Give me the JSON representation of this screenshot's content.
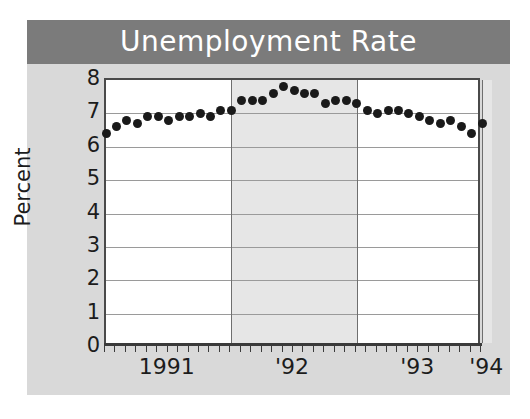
{
  "figure": {
    "title": "Unemployment Rate",
    "background_color": "#ffffff",
    "panel_color": "#d9d9d9",
    "title_bar_color": "#7b7b7b",
    "title_text_color": "#ffffff"
  },
  "chart_data": {
    "type": "scatter",
    "title": "Unemployment Rate",
    "xlabel": "",
    "ylabel": "Percent",
    "ylim": [
      0,
      8
    ],
    "yticks": [
      0,
      1,
      2,
      3,
      4,
      5,
      6,
      7,
      8
    ],
    "ytick_labels": [
      "0",
      "1",
      "2",
      "3",
      "4",
      "5",
      "6",
      "7",
      "8"
    ],
    "xtick_labels": [
      "1991",
      "'92",
      "'93",
      "'94"
    ],
    "x_year_boundaries": [
      "1991",
      "1992",
      "1993",
      "1994"
    ],
    "grid": true,
    "legend": "none",
    "marker": "filled-circle",
    "marker_color": "#1a1a1a",
    "x": [
      "1991-01",
      "1991-02",
      "1991-03",
      "1991-04",
      "1991-05",
      "1991-06",
      "1991-07",
      "1991-08",
      "1991-09",
      "1991-10",
      "1991-11",
      "1991-12",
      "1992-01",
      "1992-02",
      "1992-03",
      "1992-04",
      "1992-05",
      "1992-06",
      "1992-07",
      "1992-08",
      "1992-09",
      "1992-10",
      "1992-11",
      "1992-12",
      "1993-01",
      "1993-02",
      "1993-03",
      "1993-04",
      "1993-05",
      "1993-06",
      "1993-07",
      "1993-08",
      "1993-09",
      "1993-10",
      "1993-11",
      "1993-12",
      "1994-01"
    ],
    "values": [
      6.4,
      6.6,
      6.8,
      6.7,
      6.9,
      6.9,
      6.8,
      6.9,
      6.9,
      7.0,
      6.9,
      7.1,
      7.1,
      7.4,
      7.4,
      7.4,
      7.6,
      7.8,
      7.7,
      7.6,
      7.6,
      7.3,
      7.4,
      7.4,
      7.3,
      7.1,
      7.0,
      7.1,
      7.1,
      7.0,
      6.9,
      6.8,
      6.7,
      6.8,
      6.6,
      6.4,
      6.7
    ],
    "series": [
      {
        "name": "Unemployment Rate",
        "values": [
          6.4,
          6.6,
          6.8,
          6.7,
          6.9,
          6.9,
          6.8,
          6.9,
          6.9,
          7.0,
          6.9,
          7.1,
          7.1,
          7.4,
          7.4,
          7.4,
          7.6,
          7.8,
          7.7,
          7.6,
          7.6,
          7.3,
          7.4,
          7.4,
          7.3,
          7.1,
          7.0,
          7.1,
          7.1,
          7.0,
          6.9,
          6.8,
          6.7,
          6.8,
          6.6,
          6.4,
          6.7
        ]
      }
    ]
  }
}
